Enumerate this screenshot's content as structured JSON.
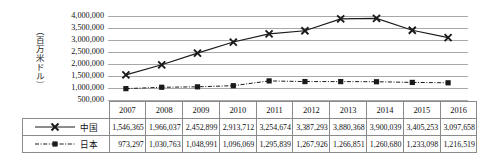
{
  "chart_data": {
    "type": "line",
    "title": "",
    "xlabel": "",
    "ylabel": "（百万米ドル）",
    "categories": [
      "2007",
      "2008",
      "2009",
      "2010",
      "2011",
      "2012",
      "2013",
      "2014",
      "2015",
      "2016"
    ],
    "ylim": [
      500000,
      4000000
    ],
    "ytick_values": [
      4000000,
      3500000,
      3000000,
      2500000,
      2000000,
      1500000,
      1000000,
      500000
    ],
    "ytick_labels": [
      "4,000,000",
      "3,500,000",
      "3,000,000",
      "2,500,000",
      "2,000,000",
      "1,500,000",
      "1,000,000",
      "500,000"
    ],
    "grid": true,
    "legend_position": "table-left",
    "series": [
      {
        "name": "中国",
        "marker": "x-cross",
        "line_style": "solid",
        "color": "#1a1a1a",
        "values": [
          1546365,
          1966037,
          2452899,
          2913712,
          3254674,
          3387293,
          3880368,
          3900039,
          3405253,
          3097658
        ],
        "labels": [
          "1,546,365",
          "1,966,037",
          "2,452,899",
          "2,913,712",
          "3,254,674",
          "3,387,293",
          "3,880,368",
          "3,900,039",
          "3,405,253",
          "3,097,658"
        ]
      },
      {
        "name": "日本",
        "marker": "filled-square",
        "line_style": "dash-dot",
        "color": "#1a1a1a",
        "values": [
          973297,
          1030763,
          1048991,
          1096069,
          1295839,
          1267926,
          1266851,
          1260680,
          1233098,
          1216519
        ],
        "labels": [
          "973,297",
          "1,030,763",
          "1,048,991",
          "1,096,069",
          "1,295,839",
          "1,267,926",
          "1,266,851",
          "1,260,680",
          "1,233,098",
          "1,216,519"
        ]
      }
    ]
  },
  "table": {
    "corner_label": "",
    "year_headers": [
      "2007",
      "2008",
      "2009",
      "2010",
      "2011",
      "2012",
      "2013",
      "2014",
      "2015",
      "2016"
    ],
    "rows": [
      {
        "legend_label": "中国",
        "values": [
          "1,546,365",
          "1,966,037",
          "2,452,899",
          "2,913,712",
          "3,254,674",
          "3,387,293",
          "3,880,368",
          "3,900,039",
          "3,405,253",
          "3,097,658"
        ]
      },
      {
        "legend_label": "日本",
        "values": [
          "973,297",
          "1,030,763",
          "1,048,991",
          "1,096,069",
          "1,295,839",
          "1,267,926",
          "1,266,851",
          "1,260,680",
          "1,233,098",
          "1,216,519"
        ]
      }
    ]
  },
  "colors": {
    "gridline": "#a8a8a8",
    "series_line": "#1a1a1a",
    "table_border": "#8a8a8a",
    "background": "#ffffff"
  }
}
